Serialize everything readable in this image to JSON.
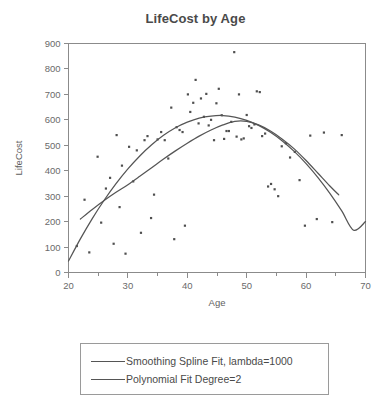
{
  "chart_data": {
    "type": "scatter",
    "title": "LifeCost by Age",
    "xlabel": "Age",
    "ylabel": "LifeCost",
    "xlim": [
      20,
      70
    ],
    "ylim": [
      0,
      900
    ],
    "xticks": [
      20,
      30,
      40,
      50,
      60,
      70
    ],
    "xminorticks": [
      25,
      35,
      45,
      55,
      65
    ],
    "yticks": [
      0,
      100,
      200,
      300,
      400,
      500,
      600,
      700,
      800,
      900
    ],
    "grid": false,
    "legend_position": "below-plot",
    "point_color": "#4f4f4f",
    "line_color": "#555555",
    "axis_color": "#8b8b8b",
    "scatter": {
      "name": "Observations",
      "x": [
        21.4,
        22.7,
        23.5,
        24.9,
        25.5,
        26.3,
        27.0,
        27.6,
        28.1,
        28.6,
        29.0,
        29.6,
        30.2,
        30.9,
        31.5,
        32.2,
        32.8,
        33.3,
        33.9,
        34.4,
        35.0,
        35.6,
        36.2,
        36.8,
        37.3,
        37.8,
        38.2,
        38.7,
        39.2,
        39.6,
        40.1,
        40.5,
        41.0,
        41.4,
        41.9,
        42.3,
        42.8,
        43.2,
        43.6,
        44.0,
        44.5,
        44.9,
        45.3,
        45.8,
        46.2,
        46.6,
        47.0,
        47.4,
        47.9,
        48.3,
        48.7,
        49.1,
        49.5,
        50.0,
        50.4,
        50.8,
        51.3,
        51.7,
        52.2,
        52.6,
        53.1,
        53.6,
        54.1,
        54.7,
        55.3,
        55.9,
        56.6,
        57.3,
        58.1,
        58.9,
        59.8,
        60.7,
        61.8,
        63.0,
        64.4,
        66.0
      ],
      "y": [
        104,
        286,
        79,
        455,
        196,
        330,
        372,
        113,
        540,
        257,
        420,
        74,
        494,
        358,
        480,
        156,
        520,
        536,
        214,
        306,
        523,
        552,
        520,
        448,
        648,
        131,
        571,
        560,
        552,
        184,
        700,
        631,
        667,
        757,
        586,
        684,
        612,
        702,
        578,
        600,
        520,
        665,
        722,
        618,
        525,
        556,
        556,
        592,
        866,
        534,
        700,
        523,
        527,
        619,
        575,
        568,
        582,
        712,
        709,
        536,
        546,
        338,
        348,
        327,
        300,
        496,
        508,
        452,
        474,
        363,
        184,
        538,
        210,
        550,
        198,
        540
      ]
    },
    "fits": [
      {
        "name": "Smoothing Spline Fit, lambda=1000",
        "label": "Smoothing Spline Fit, lambda=1000",
        "x": [
          22.0,
          24.0,
          26.0,
          28.0,
          30.0,
          32.0,
          34.0,
          36.0,
          38.0,
          40.0,
          42.0,
          44.0,
          46.0,
          48.0,
          50.0,
          52.0,
          54.0,
          56.0,
          58.0,
          60.0,
          62.0,
          64.0,
          65.5
        ],
        "y": [
          210,
          248,
          283,
          315,
          345,
          378,
          412,
          446,
          478,
          508,
          536,
          560,
          580,
          594,
          594,
          580,
          556,
          524,
          486,
          440,
          390,
          340,
          305
        ]
      },
      {
        "name": "Polynomial Fit Degree=2",
        "label": "Polynomial Fit Degree=2",
        "x": [
          20.0,
          22.0,
          24.0,
          26.0,
          28.0,
          30.0,
          32.0,
          34.0,
          36.0,
          38.0,
          40.0,
          42.0,
          44.0,
          46.0,
          48.0,
          50.0,
          52.0,
          54.0,
          56.0,
          58.0,
          60.0,
          62.0,
          64.0,
          66.0,
          68.0,
          70.0
        ],
        "y": [
          45,
          132,
          212,
          284,
          349,
          407,
          458,
          502,
          539,
          569,
          591,
          607,
          615,
          617,
          611,
          598,
          578,
          551,
          517,
          476,
          428,
          373,
          311,
          242,
          166,
          200
        ]
      }
    ]
  },
  "legend": {
    "items": [
      {
        "label": "Smoothing Spline Fit, lambda=1000"
      },
      {
        "label": "Polynomial Fit Degree=2"
      }
    ]
  }
}
